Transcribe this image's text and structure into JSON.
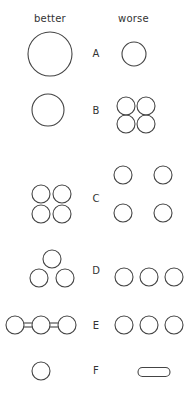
{
  "header": {
    "better_label": "better",
    "worse_label": "worse"
  },
  "style": {
    "stroke_color": "#444444",
    "background": "#ffffff"
  },
  "rows": [
    {
      "label": "A",
      "better": {
        "description": "one large circle"
      },
      "worse": {
        "description": "one small circle"
      }
    },
    {
      "label": "B",
      "better": {
        "description": "one medium circle"
      },
      "worse": {
        "description": "four small touching circles in 2x2 cluster"
      }
    },
    {
      "label": "C",
      "better": {
        "description": "four small circles clustered 2x2"
      },
      "worse": {
        "description": "four small circles spread apart"
      }
    },
    {
      "label": "D",
      "better": {
        "description": "three circles in triangle arrangement"
      },
      "worse": {
        "description": "three circles in a row"
      }
    },
    {
      "label": "E",
      "better": {
        "description": "three circles connected by double bonds"
      },
      "worse": {
        "description": "three separate circles in a row"
      }
    },
    {
      "label": "F",
      "better": {
        "description": "one small circle"
      },
      "worse": {
        "description": "elongated flat pill shape"
      }
    }
  ]
}
